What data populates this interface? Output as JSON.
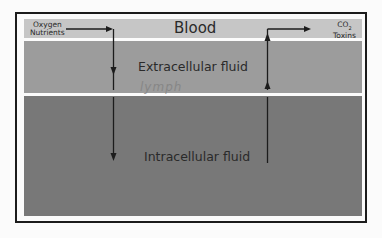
{
  "diagram": {
    "compartments": {
      "blood": {
        "label": "Blood",
        "color": "#c6c6c6"
      },
      "extracellular": {
        "label": "Extracellular fluid",
        "color": "#9c9c9c"
      },
      "intracellular": {
        "label": "Intracellular fluid",
        "color": "#787878"
      }
    },
    "inputs": {
      "line1": "Oxygen",
      "line2": "Nutrients"
    },
    "outputs": {
      "line1": "CO",
      "line1_sub": "2",
      "line2": "Toxins"
    },
    "watermark": "lymph",
    "arrow_color": "#1c1c1c",
    "frame_color": "#1c1c1c"
  }
}
